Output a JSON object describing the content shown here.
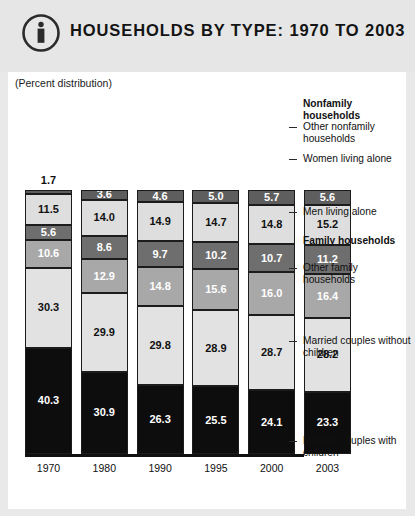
{
  "header": {
    "title": "HOUSEHOLDS BY TYPE: 1970 TO 2003",
    "icon": "info-circle-icon"
  },
  "subtitle": "(Percent distribution)",
  "legend": {
    "nonfamily_heading": "Nonfamily households",
    "family_heading": "Family households",
    "items": [
      {
        "label": "Other nonfamily households"
      },
      {
        "label": "Women living alone"
      },
      {
        "label": "Men living alone"
      },
      {
        "label": "Other family households"
      },
      {
        "label": "Married couples without children"
      },
      {
        "label": "Married couples with children"
      }
    ]
  },
  "colors": {
    "other_nonfamily": "#5e5e5e",
    "women_alone": "#dedede",
    "men_alone": "#6e6e6e",
    "other_family": "#a8a8a8",
    "married_without_children": "#e2e2e2",
    "married_with_children": "#0d0d0d",
    "panel": "#ffffff",
    "background": "#e6e6e6"
  },
  "chart_data": {
    "type": "bar",
    "title": "HOUSEHOLDS BY TYPE: 1970 TO 2003",
    "subtitle": "(Percent distribution)",
    "xlabel": "",
    "ylabel": "Percent distribution",
    "ylim": [
      0,
      100
    ],
    "stacked": true,
    "grid": false,
    "legend_position": "right",
    "categories": [
      "1970",
      "1980",
      "1990",
      "1995",
      "2000",
      "2003"
    ],
    "series": [
      {
        "name": "Other nonfamily households",
        "values": [
          1.7,
          3.6,
          4.6,
          5.0,
          5.7,
          5.6
        ]
      },
      {
        "name": "Women living alone",
        "values": [
          11.5,
          14.0,
          14.9,
          14.7,
          14.8,
          15.2
        ]
      },
      {
        "name": "Men living alone",
        "values": [
          5.6,
          8.6,
          9.7,
          10.2,
          10.7,
          11.2
        ]
      },
      {
        "name": "Other family households",
        "values": [
          10.6,
          12.9,
          14.8,
          15.6,
          16.0,
          16.4
        ]
      },
      {
        "name": "Married couples without children",
        "values": [
          30.3,
          29.9,
          29.8,
          28.9,
          28.7,
          28.2
        ]
      },
      {
        "name": "Married couples with children",
        "values": [
          40.3,
          30.9,
          26.3,
          25.5,
          24.1,
          23.3
        ]
      }
    ]
  },
  "bars": [
    {
      "year": "1970",
      "label_outside": "1.7",
      "segments": [
        {
          "name": "other-nonfamily",
          "value": "1.7",
          "inside": false
        },
        {
          "name": "women-alone",
          "value": "11.5",
          "inside": true
        },
        {
          "name": "men-alone",
          "value": "5.6",
          "inside": true
        },
        {
          "name": "other-family",
          "value": "10.6",
          "inside": true
        },
        {
          "name": "married-without",
          "value": "30.3",
          "inside": true
        },
        {
          "name": "married-with",
          "value": "40.3",
          "inside": true
        }
      ]
    },
    {
      "year": "1980",
      "segments": [
        {
          "name": "other-nonfamily",
          "value": "3.6",
          "inside": true
        },
        {
          "name": "women-alone",
          "value": "14.0",
          "inside": true
        },
        {
          "name": "men-alone",
          "value": "8.6",
          "inside": true
        },
        {
          "name": "other-family",
          "value": "12.9",
          "inside": true
        },
        {
          "name": "married-without",
          "value": "29.9",
          "inside": true
        },
        {
          "name": "married-with",
          "value": "30.9",
          "inside": true
        }
      ]
    },
    {
      "year": "1990",
      "segments": [
        {
          "name": "other-nonfamily",
          "value": "4.6",
          "inside": true
        },
        {
          "name": "women-alone",
          "value": "14.9",
          "inside": true
        },
        {
          "name": "men-alone",
          "value": "9.7",
          "inside": true
        },
        {
          "name": "other-family",
          "value": "14.8",
          "inside": true
        },
        {
          "name": "married-without",
          "value": "29.8",
          "inside": true
        },
        {
          "name": "married-with",
          "value": "26.3",
          "inside": true
        }
      ]
    },
    {
      "year": "1995",
      "segments": [
        {
          "name": "other-nonfamily",
          "value": "5.0",
          "inside": true
        },
        {
          "name": "women-alone",
          "value": "14.7",
          "inside": true
        },
        {
          "name": "men-alone",
          "value": "10.2",
          "inside": true
        },
        {
          "name": "other-family",
          "value": "15.6",
          "inside": true
        },
        {
          "name": "married-without",
          "value": "28.9",
          "inside": true
        },
        {
          "name": "married-with",
          "value": "25.5",
          "inside": true
        }
      ]
    },
    {
      "year": "2000",
      "segments": [
        {
          "name": "other-nonfamily",
          "value": "5.7",
          "inside": true
        },
        {
          "name": "women-alone",
          "value": "14.8",
          "inside": true
        },
        {
          "name": "men-alone",
          "value": "10.7",
          "inside": true
        },
        {
          "name": "other-family",
          "value": "16.0",
          "inside": true
        },
        {
          "name": "married-without",
          "value": "28.7",
          "inside": true
        },
        {
          "name": "married-with",
          "value": "24.1",
          "inside": true
        }
      ]
    },
    {
      "year": "2003",
      "segments": [
        {
          "name": "other-nonfamily",
          "value": "5.6",
          "inside": true
        },
        {
          "name": "women-alone",
          "value": "15.2",
          "inside": true
        },
        {
          "name": "men-alone",
          "value": "11.2",
          "inside": true
        },
        {
          "name": "other-family",
          "value": "16.4",
          "inside": true
        },
        {
          "name": "married-without",
          "value": "28.2",
          "inside": true
        },
        {
          "name": "married-with",
          "value": "23.3",
          "inside": true
        }
      ]
    }
  ]
}
